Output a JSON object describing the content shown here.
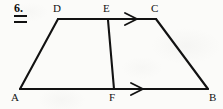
{
  "figure": {
    "problem_number": "6.",
    "problem_number_marker": "double-underline",
    "type": "geometry-diagram",
    "shape": "trapezoid",
    "canvas": {
      "width": 223,
      "height": 109
    },
    "background_color": "#fbfbf9",
    "stroke_color": "#121212",
    "vertices": [
      {
        "label": "A",
        "x": 20,
        "y": 89,
        "label_x": 13,
        "label_y": 92
      },
      {
        "label": "B",
        "x": 208,
        "y": 89,
        "label_x": 210,
        "label_y": 92
      },
      {
        "label": "C",
        "x": 156,
        "y": 19,
        "label_x": 152,
        "label_y": 5
      },
      {
        "label": "D",
        "x": 58,
        "y": 19,
        "label_x": 55,
        "label_y": 5
      },
      {
        "label": "E",
        "x": 108,
        "y": 19,
        "label_x": 104,
        "label_y": 5
      },
      {
        "label": "F",
        "x": 114,
        "y": 89,
        "label_x": 110,
        "label_y": 92
      }
    ],
    "segments": [
      {
        "name": "AB",
        "from": "A",
        "to": "B"
      },
      {
        "name": "DC",
        "from": "D",
        "to": "C"
      },
      {
        "name": "AD",
        "from": "A",
        "to": "D"
      },
      {
        "name": "BC",
        "from": "B",
        "to": "C"
      },
      {
        "name": "EF",
        "from": "E",
        "to": "F"
      }
    ],
    "arrow_marks": [
      {
        "name": "arrow-on-EC",
        "on_segment": "EC",
        "x": 130,
        "y": 19,
        "direction": "right"
      },
      {
        "name": "arrow-on-FB",
        "on_segment": "FB",
        "x": 136,
        "y": 89,
        "direction": "right"
      }
    ]
  }
}
